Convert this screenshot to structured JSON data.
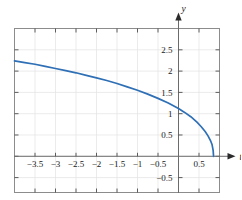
{
  "chart_data": {
    "type": "line",
    "title": "",
    "xlabel": "t",
    "ylabel": "y",
    "xlim": [
      -4.0,
      1.0
    ],
    "ylim": [
      -0.85,
      3.0
    ],
    "grid": true,
    "legend": false,
    "axis_arrows": true,
    "xticks": [
      -3.5,
      -3,
      -2.5,
      -2,
      -1.5,
      -1,
      -0.5,
      0.5
    ],
    "xtick_labels": [
      "−3.5",
      "−3",
      "−2.5",
      "−2",
      "−1.5",
      "−1",
      "−0.5",
      "0.5"
    ],
    "yticks": [
      2.5,
      2,
      1.5,
      1,
      0.5,
      -0.5
    ],
    "ytick_labels": [
      "2.5",
      "2",
      "1.5",
      "1",
      "0.5",
      "−0.5"
    ],
    "gridstep_x": 0.5,
    "gridstep_y": 0.5,
    "series": [
      {
        "name": "curve",
        "color": "#2e6fb5",
        "x": [
          -4.0,
          -3.75,
          -3.5,
          -3.25,
          -3.0,
          -2.75,
          -2.5,
          -2.25,
          -2.0,
          -1.75,
          -1.5,
          -1.25,
          -1.0,
          -0.75,
          -0.5,
          -0.25,
          0.0,
          0.15,
          0.3,
          0.45,
          0.55,
          0.65,
          0.72,
          0.78,
          0.82,
          0.845,
          0.855
        ],
        "y": [
          2.24,
          2.2,
          2.16,
          2.11,
          2.06,
          2.01,
          1.96,
          1.9,
          1.84,
          1.78,
          1.71,
          1.63,
          1.55,
          1.46,
          1.36,
          1.25,
          1.12,
          1.03,
          0.93,
          0.8,
          0.7,
          0.58,
          0.48,
          0.37,
          0.27,
          0.14,
          0.0
        ]
      }
    ]
  },
  "labels": {
    "y_axis_name": "y",
    "t_axis_name": "t"
  }
}
